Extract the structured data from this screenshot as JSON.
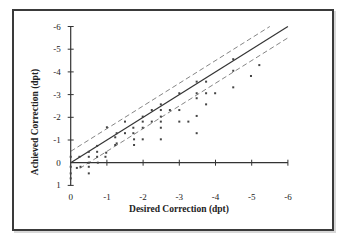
{
  "chart_data": {
    "type": "scatter",
    "title": "",
    "xlabel": "Desired Correction (dpt)",
    "ylabel": "Achieved Correction (dpt)",
    "xlim": [
      0,
      -6
    ],
    "ylim": [
      1,
      -6
    ],
    "x_ticks": [
      0,
      -1,
      -2,
      -3,
      -4,
      -5,
      -6
    ],
    "x_tick_labels": [
      "0",
      "-1",
      "-2",
      "-3",
      "-4",
      "-5",
      "-6"
    ],
    "y_ticks": [
      1,
      0,
      -1,
      -2,
      -3,
      -4,
      -5,
      -6
    ],
    "y_tick_labels": [
      "1",
      "0",
      "-1",
      "-2",
      "-3",
      "-4",
      "-5",
      "-6"
    ],
    "grid": false,
    "legend": null,
    "reference_lines": [
      {
        "name": "identity",
        "style": "solid",
        "slope": 1,
        "intercept": 0,
        "x_range": [
          0,
          -6
        ]
      },
      {
        "name": "upper tolerance (+0.5 dpt)",
        "style": "dashed",
        "slope": 1,
        "intercept": -0.5,
        "x_range": [
          0,
          -5.5
        ]
      },
      {
        "name": "lower tolerance (-0.5 dpt)",
        "style": "dashed",
        "slope": 1,
        "intercept": 0.5,
        "x_range": [
          -0.25,
          -6
        ]
      }
    ],
    "series": [
      {
        "name": "eyes",
        "points": [
          [
            0,
            -0.26
          ],
          [
            0,
            0.18
          ],
          [
            0,
            0.47
          ],
          [
            0,
            0.69
          ],
          [
            -0.17,
            0.23
          ],
          [
            -0.24,
            -0.26
          ],
          [
            -0.27,
            0.18
          ],
          [
            -0.5,
            -0.26
          ],
          [
            -0.5,
            -0.48
          ],
          [
            -0.5,
            0
          ],
          [
            -0.5,
            0.18
          ],
          [
            -0.5,
            0.47
          ],
          [
            -0.73,
            -0.26
          ],
          [
            -0.73,
            -0.48
          ],
          [
            -0.73,
            -0.74
          ],
          [
            -0.75,
            0
          ],
          [
            -0.96,
            -0.26
          ],
          [
            -0.98,
            -0.44
          ],
          [
            -1.0,
            -1.56
          ],
          [
            -1.23,
            -1.12
          ],
          [
            -1.23,
            -0.78
          ],
          [
            -1.27,
            -1.3
          ],
          [
            -1.27,
            -0.85
          ],
          [
            -1.5,
            -1.81
          ],
          [
            -1.5,
            -1.3
          ],
          [
            -1.73,
            -1.54
          ],
          [
            -1.73,
            -1.3
          ],
          [
            -1.75,
            -1.03
          ],
          [
            -1.75,
            -0.78
          ],
          [
            -1.99,
            -2.03
          ],
          [
            -1.99,
            -1.81
          ],
          [
            -1.99,
            -1.54
          ],
          [
            -1.99,
            -1.03
          ],
          [
            -2.24,
            -2.32
          ],
          [
            -2.24,
            -1.81
          ],
          [
            -2.49,
            -2.57
          ],
          [
            -2.49,
            -2.32
          ],
          [
            -2.49,
            -2.03
          ],
          [
            -2.49,
            -1.81
          ],
          [
            -2.49,
            -1.54
          ],
          [
            -2.49,
            -1.03
          ],
          [
            -2.74,
            -2.32
          ],
          [
            -3.0,
            -3.06
          ],
          [
            -3.0,
            -2.32
          ],
          [
            -3.0,
            -1.81
          ],
          [
            -3.25,
            -1.81
          ],
          [
            -3.48,
            -3.57
          ],
          [
            -3.74,
            -3.57
          ],
          [
            -3.48,
            -3.06
          ],
          [
            -3.74,
            -3.06
          ],
          [
            -3.99,
            -3.06
          ],
          [
            -3.48,
            -2.84
          ],
          [
            -3.74,
            -2.57
          ],
          [
            -3.48,
            -2.06
          ],
          [
            -3.48,
            -1.3
          ],
          [
            -4.49,
            -4.56
          ],
          [
            -4.49,
            -4.05
          ],
          [
            -4.49,
            -3.32
          ],
          [
            -4.98,
            -3.82
          ],
          [
            -5.21,
            -4.3
          ]
        ]
      }
    ]
  },
  "layout": {
    "origin_px": [
      70.7,
      162.7
    ],
    "px_per_dpt_x": 36.2,
    "px_per_dpt_y": 22.7,
    "colors": {
      "axis": "#333333",
      "identity_line": "#333333",
      "dashed_line": "#777777",
      "point": "#444444",
      "frame": "#3a3a3a"
    }
  }
}
